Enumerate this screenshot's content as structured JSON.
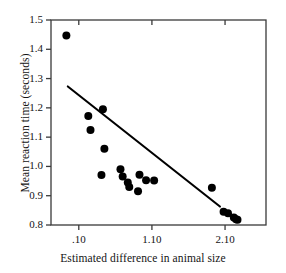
{
  "chart_data": {
    "type": "scatter",
    "title": "",
    "xlabel": "Estimated difference in animal size",
    "ylabel": "Mean reaction time (seconds)",
    "x_tick_labels": [
      ".10",
      "1.10",
      "2.10"
    ],
    "x_tick_values": [
      0.1,
      1.1,
      2.1
    ],
    "y_tick_labels": [
      "1.5",
      "1.4",
      "1.3",
      "1.2",
      "1.1",
      "1.0",
      "0.9",
      "0.8"
    ],
    "y_tick_values": [
      1.5,
      1.4,
      1.3,
      1.2,
      1.1,
      1.0,
      0.9,
      0.8
    ],
    "xlim": [
      -0.28,
      2.66
    ],
    "ylim": [
      0.8,
      1.5
    ],
    "grid": false,
    "legend": false,
    "marker_color": "#000000",
    "marker_size": 4.0,
    "line_color": "#000000",
    "frame_color": "#3a3a3a",
    "points": [
      {
        "x": -0.07,
        "y": 1.447
      },
      {
        "x": 0.23,
        "y": 1.172
      },
      {
        "x": 0.26,
        "y": 1.124
      },
      {
        "x": 0.43,
        "y": 1.195
      },
      {
        "x": 0.45,
        "y": 1.06
      },
      {
        "x": 0.41,
        "y": 0.971
      },
      {
        "x": 0.67,
        "y": 0.99
      },
      {
        "x": 0.7,
        "y": 0.966
      },
      {
        "x": 0.77,
        "y": 0.945
      },
      {
        "x": 0.79,
        "y": 0.93
      },
      {
        "x": 0.93,
        "y": 0.972
      },
      {
        "x": 0.91,
        "y": 0.915
      },
      {
        "x": 1.02,
        "y": 0.953
      },
      {
        "x": 1.13,
        "y": 0.952
      },
      {
        "x": 1.92,
        "y": 0.927
      },
      {
        "x": 2.08,
        "y": 0.845
      },
      {
        "x": 2.14,
        "y": 0.84
      },
      {
        "x": 2.22,
        "y": 0.826
      },
      {
        "x": 2.25,
        "y": 0.82
      },
      {
        "x": 2.27,
        "y": 0.818
      }
    ],
    "fit_line": {
      "x_start": -0.05,
      "y_start": 1.273,
      "x_end": 2.03,
      "y_end": 0.863
    }
  }
}
